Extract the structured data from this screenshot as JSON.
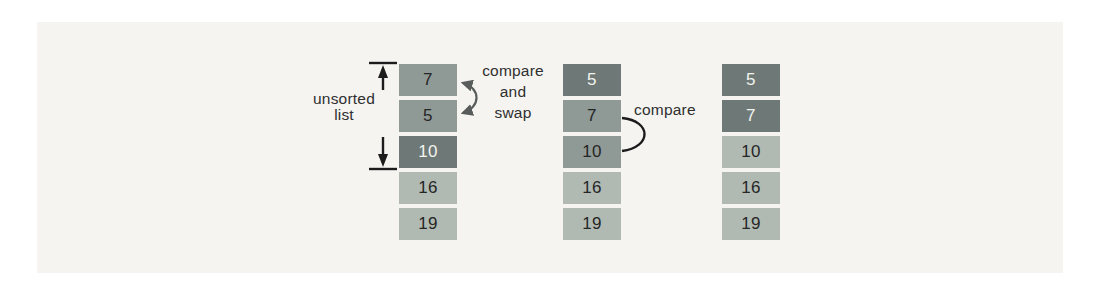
{
  "labels": {
    "unsorted_line1": "unsorted",
    "unsorted_line2": "list",
    "compare_swap_line1": "compare",
    "compare_swap_line2": "and",
    "compare_swap_line3": "swap",
    "compare": "compare"
  },
  "lists": [
    {
      "name": "step-1-unsorted",
      "cells": [
        {
          "value": "7",
          "tone": "medium"
        },
        {
          "value": "5",
          "tone": "medium"
        },
        {
          "value": "10",
          "tone": "dark"
        },
        {
          "value": "16",
          "tone": "light"
        },
        {
          "value": "19",
          "tone": "light"
        }
      ]
    },
    {
      "name": "step-2-after-swap",
      "cells": [
        {
          "value": "5",
          "tone": "dark"
        },
        {
          "value": "7",
          "tone": "medium"
        },
        {
          "value": "10",
          "tone": "medium"
        },
        {
          "value": "16",
          "tone": "light"
        },
        {
          "value": "19",
          "tone": "light"
        }
      ]
    },
    {
      "name": "step-3-result",
      "cells": [
        {
          "value": "5",
          "tone": "dark"
        },
        {
          "value": "7",
          "tone": "dark"
        },
        {
          "value": "10",
          "tone": "light"
        },
        {
          "value": "16",
          "tone": "light"
        },
        {
          "value": "19",
          "tone": "light"
        }
      ]
    }
  ],
  "icons": {
    "range_bracket": "double-ended-vertical-range-arrows",
    "swap_arrow": "curved-double-headed-arrow",
    "compare_arc": "arc-connector"
  },
  "colors": {
    "page_bg": "#ffffff",
    "panel_bg": "#f5f4f1",
    "cell_dark": "#6e7977",
    "cell_medium": "#8f9995",
    "cell_light": "#b0bab3",
    "cell_text_dark": "#262626",
    "cell_text_light": "#f3f3ee",
    "annotation_text": "#2f2f2f",
    "swap_arrow": "#585d5c",
    "line_black": "#1c1c1c"
  }
}
